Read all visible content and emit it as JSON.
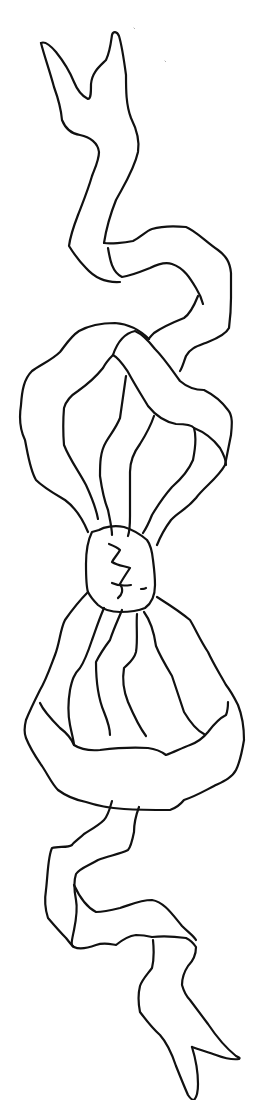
{
  "image": {
    "subject": "Line drawing of a ribbon bow with long wavy streamers",
    "width": 259,
    "height": 1100,
    "background_color": "#ffffff",
    "line_color": "#111111",
    "line_width": 2.2
  },
  "parts": [
    {
      "name": "top-streamer",
      "label": "Upper ribbon tail with forked end"
    },
    {
      "name": "upper-loop",
      "label": "Upper bow loop"
    },
    {
      "name": "knot",
      "label": "Central knot"
    },
    {
      "name": "lower-loop",
      "label": "Lower bow loop"
    },
    {
      "name": "bottom-streamer",
      "label": "Lower ribbon tail with forked end"
    }
  ]
}
